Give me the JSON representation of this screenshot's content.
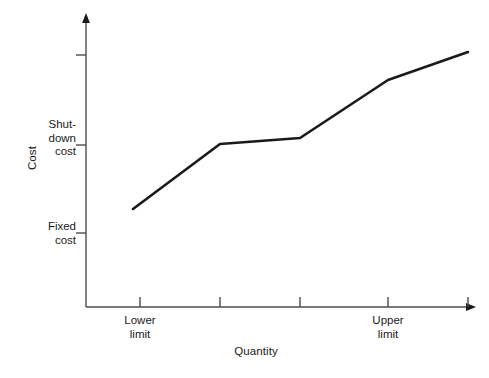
{
  "chart_data": {
    "type": "line",
    "title": "",
    "subtitle": "",
    "xlabel": "Quantity",
    "ylabel": "Cost",
    "grid": false,
    "legend": false,
    "legend_position": "none",
    "line_color": "#1a1a1a",
    "axis_color": "#4d4d4d",
    "background_color": "#ffffff",
    "xlim": [
      0,
      10
    ],
    "ylim": [
      0,
      10
    ],
    "x_tick_labels": [
      "",
      "Lower\nlimit",
      "",
      "",
      "Upper\nlimit",
      ""
    ],
    "y_tick_labels": [
      "",
      "Fixed\ncost",
      "Shut-\ndown\ncost",
      ""
    ],
    "x_named_ticks": [
      {
        "name": "lower-limit",
        "label_line1": "Lower",
        "label_line2": "limit",
        "x": 140
      },
      {
        "name": "upper-limit",
        "label_line1": "Upper",
        "label_line2": "limit",
        "x": 388
      }
    ],
    "y_named_ticks": [
      {
        "name": "fixed-cost",
        "label_line1": "Fixed",
        "label_line2": "cost",
        "label_line3": "",
        "y": 233
      },
      {
        "name": "shutdown-cost",
        "label_line1": "Shut-",
        "label_line2": "down",
        "label_line3": "cost",
        "y": 145
      }
    ],
    "x_tick_positions": [
      140,
      220,
      300,
      388,
      468
    ],
    "y_tick_positions": [
      55,
      145,
      233
    ],
    "series": [
      {
        "name": "total-cost-curve",
        "points": [
          {
            "x": 133,
            "y": 209
          },
          {
            "x": 220,
            "y": 144
          },
          {
            "x": 300,
            "y": 138
          },
          {
            "x": 388,
            "y": 80
          },
          {
            "x": 468,
            "y": 52
          }
        ],
        "values_description": "Cost rises steeply from fixed cost up to shutdown cost at the lower limit, stays nearly flat through the normal operating range, then rises again past the upper limit."
      }
    ],
    "annotations": []
  },
  "labels": {
    "y_axis_title": "Cost",
    "x_axis_title": "Quantity",
    "shutdown_cost": "Shut-\ndown\ncost",
    "shutdown_cost_l1": "Shut-",
    "shutdown_cost_l2": "down",
    "shutdown_cost_l3": "cost",
    "fixed_cost_l1": "Fixed",
    "fixed_cost_l2": "cost",
    "lower_limit_l1": "Lower",
    "lower_limit_l2": "limit",
    "upper_limit_l1": "Upper",
    "upper_limit_l2": "limit"
  }
}
